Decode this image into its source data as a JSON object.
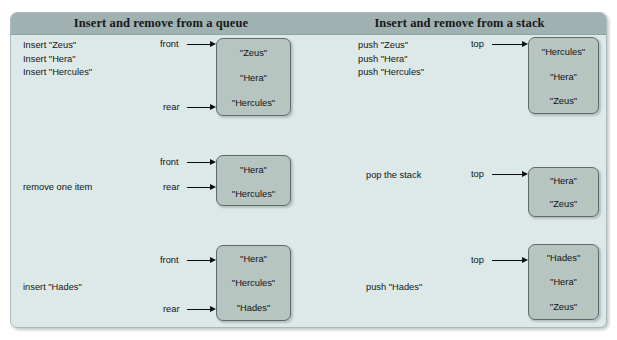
{
  "figure": {
    "headers": {
      "queue": "Insert and remove from a queue",
      "stack": "Insert and remove from a stack"
    },
    "rows": [
      {
        "id": "row-initial",
        "queue": {
          "operations": [
            "Insert \"Zeus\"",
            "Insert \"Hera\"",
            "Insert \"Hercules\""
          ],
          "pointers": [
            {
              "label": "front",
              "target_index": 0
            },
            {
              "label": "rear",
              "target_index": 2
            }
          ],
          "items": [
            "\"Zeus\"",
            "\"Hera\"",
            "\"Hercules\""
          ]
        },
        "stack": {
          "operations": [
            "push \"Zeus\"",
            "push \"Hera\"",
            "push \"Hercules\""
          ],
          "pointers": [
            {
              "label": "top",
              "target_index": 0
            }
          ],
          "items": [
            "\"Hercules\"",
            "\"Hera\"",
            "\"Zeus\""
          ]
        }
      },
      {
        "id": "row-remove",
        "queue": {
          "operations": [
            "remove one item"
          ],
          "pointers": [
            {
              "label": "front",
              "target_index": 0
            },
            {
              "label": "rear",
              "target_index": 1
            }
          ],
          "items": [
            "\"Hera\"",
            "\"Hercules\""
          ]
        },
        "stack": {
          "operations": [
            "pop the stack"
          ],
          "pointers": [
            {
              "label": "top",
              "target_index": 0
            }
          ],
          "items": [
            "\"Hera\"",
            "\"Zeus\""
          ]
        }
      },
      {
        "id": "row-insert-hades",
        "queue": {
          "operations": [
            "insert \"Hades\""
          ],
          "pointers": [
            {
              "label": "front",
              "target_index": 0
            },
            {
              "label": "rear",
              "target_index": 2
            }
          ],
          "items": [
            "\"Hera\"",
            "\"Hercules\"",
            "\"Hades\""
          ]
        },
        "stack": {
          "operations": [
            "push \"Hades\""
          ],
          "pointers": [
            {
              "label": "top",
              "target_index": 0
            }
          ],
          "items": [
            "\"Hades\"",
            "\"Hera\"",
            "\"Zeus\""
          ]
        }
      }
    ],
    "colors": {
      "panel_background": "#dde9e8",
      "header_band": "#9fb2b1",
      "box_fill": "#b7c5c0",
      "box_border": "#5d6b68",
      "text": "#121416"
    }
  }
}
